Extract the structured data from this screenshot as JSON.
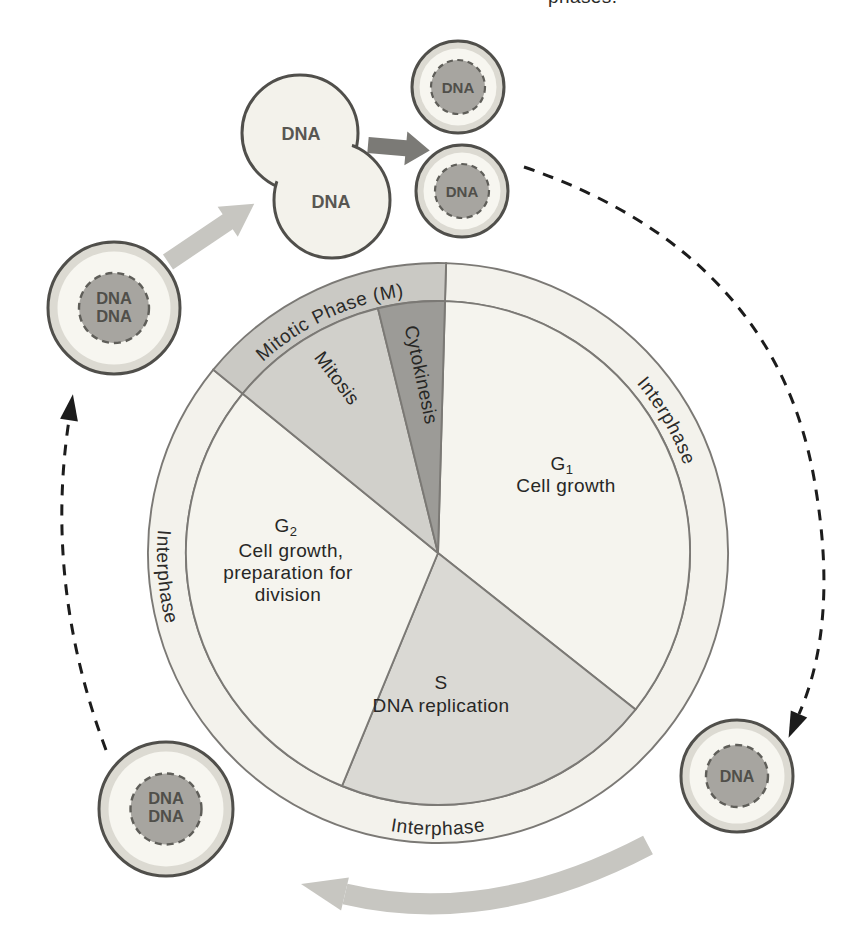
{
  "caption": {
    "fragment": "phases."
  },
  "ring": {
    "mitotic": "Mitotic Phase (M)",
    "interphase_right": "Interphase",
    "interphase_left": "Interphase",
    "interphase_bottom": "Interphase"
  },
  "sectors": {
    "g1": {
      "symbol": "G",
      "sub": "1",
      "desc": "Cell growth"
    },
    "s": {
      "symbol": "S",
      "desc": "DNA replication"
    },
    "g2": {
      "symbol": "G",
      "sub": "2",
      "desc1": "Cell growth,",
      "desc2": "preparation for",
      "desc3": "division"
    },
    "mitosis": {
      "label": "Mitosis"
    },
    "cytokinesis": {
      "label": "Cytokinesis"
    }
  },
  "cells": {
    "parent": {
      "dna1": "DNA",
      "dna2": "DNA"
    },
    "dividing": {
      "dna_top": "DNA",
      "dna_bottom": "DNA"
    },
    "daughter_upper": {
      "dna": "DNA"
    },
    "daughter_lower": {
      "dna": "DNA"
    },
    "g1_cell": {
      "dna": "DNA"
    },
    "s_cell": {
      "dna1": "DNA",
      "dna2": "DNA"
    }
  },
  "colors": {
    "page_bg": "#ffffff",
    "sector_light": "#f5f4ee",
    "sector_s": "#dad9d4",
    "sector_mitosis": "#d1d0cb",
    "sector_cytokinesis": "#9c9b97",
    "ring_light": "#f3f2ec",
    "ring_mitotic": "#cac9c4",
    "cell_rim": "#dcdad2",
    "cell_body": "#f7f6f0",
    "dividing_body": "#f3f2eb",
    "nucleus": "#a7a5a0",
    "arrow_dark": "#7b7a76",
    "arrow_light": "#c7c6c1",
    "dashed_arrow": "#1c1c1c"
  }
}
